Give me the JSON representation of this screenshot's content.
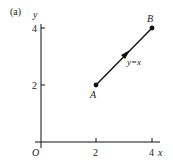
{
  "figure": {
    "panel_label": "(a)",
    "axes": {
      "x_label": "x",
      "y_label": "y",
      "origin_label": "O",
      "x_ticks": [
        "2",
        "4"
      ],
      "y_ticks": [
        "2",
        "4"
      ]
    },
    "points": [
      {
        "name": "A",
        "x": 2,
        "y": 2
      },
      {
        "name": "B",
        "x": 4,
        "y": 4
      }
    ],
    "curve": {
      "label": "y=x",
      "from": "A",
      "to": "B",
      "direction": "A-to-B"
    },
    "colors": {
      "ink": "#111111",
      "background": "#ffffff"
    }
  }
}
